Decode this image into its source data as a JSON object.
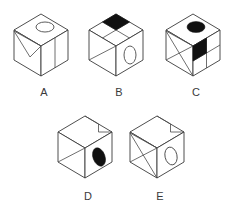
{
  "page": {
    "background_color": "#ffffff",
    "line_color": "#3a3a3a",
    "fill_color": "#111111",
    "width": 237,
    "height": 211
  },
  "options": [
    {
      "id": "A",
      "label": "A",
      "label_x": 44,
      "label_y": 96,
      "origin_x": 14,
      "origin_y": 12,
      "top_face": {
        "markings": [
          "open-ellipse"
        ],
        "ellipse_fill": "none"
      },
      "left_face": {
        "markings": [
          "v-triangle-outline"
        ]
      },
      "right_face": {
        "markings": [
          "vertical-divider"
        ]
      }
    },
    {
      "id": "B",
      "label": "B",
      "label_x": 119,
      "label_y": 96,
      "origin_x": 89,
      "origin_y": 12,
      "top_face": {
        "markings": [
          "quadrant-grid",
          "black-quadrant-top"
        ],
        "black_quadrant": "top"
      },
      "left_face": {
        "markings": [
          "diagonal"
        ]
      },
      "right_face": {
        "markings": [
          "open-ellipse"
        ],
        "ellipse_fill": "none"
      }
    },
    {
      "id": "C",
      "label": "C",
      "label_x": 196,
      "label_y": 96,
      "origin_x": 166,
      "origin_y": 12,
      "top_face": {
        "markings": [
          "solid-ellipse"
        ],
        "ellipse_fill": "#111111"
      },
      "left_face": {
        "markings": [
          "triangle-lines"
        ]
      },
      "right_face": {
        "markings": [
          "quad-grid",
          "black-cell-upper-left"
        ],
        "black_cell": "upper-left"
      }
    },
    {
      "id": "D",
      "label": "D",
      "label_x": 88,
      "label_y": 200,
      "origin_x": 58,
      "origin_y": 114,
      "top_face": {
        "markings": [
          "stepped-notch"
        ]
      },
      "left_face": {
        "markings": [
          "diagonal"
        ]
      },
      "right_face": {
        "markings": [
          "solid-ellipse"
        ],
        "ellipse_fill": "#111111"
      }
    },
    {
      "id": "E",
      "label": "E",
      "label_x": 160,
      "label_y": 200,
      "origin_x": 130,
      "origin_y": 114,
      "top_face": {
        "markings": [
          "stepped-notch"
        ]
      },
      "left_face": {
        "markings": [
          "triangle-lines"
        ]
      },
      "right_face": {
        "markings": [
          "open-ellipse"
        ],
        "ellipse_fill": "none"
      }
    }
  ]
}
